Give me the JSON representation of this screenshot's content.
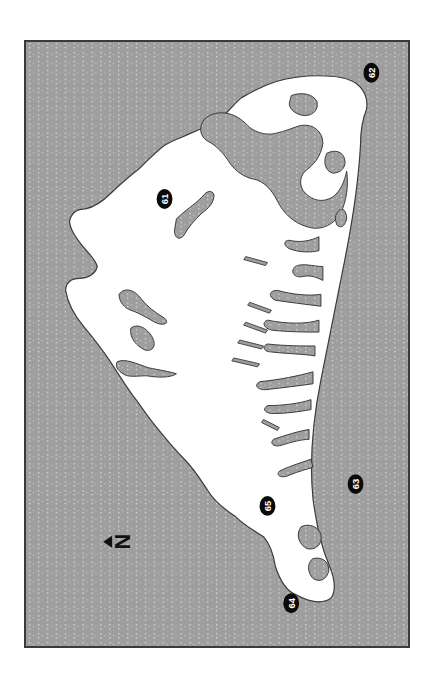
{
  "map": {
    "type": "island-map",
    "orientation": "rotated-90-ccw",
    "colors": {
      "water": "#9e9e9e",
      "water_dots": "#d8d8d8",
      "land": "#ffffff",
      "coastline": "#3a3a3a",
      "frame": "#3a3a3a",
      "marker_fill": "#0a0a0a",
      "marker_text": "#ffffff"
    },
    "north_arrow": {
      "label": "N",
      "direction": "left"
    },
    "markers": [
      {
        "id": "61",
        "label": "61"
      },
      {
        "id": "62",
        "label": "62"
      },
      {
        "id": "63",
        "label": "63"
      },
      {
        "id": "64",
        "label": "64"
      },
      {
        "id": "65",
        "label": "65"
      }
    ]
  }
}
